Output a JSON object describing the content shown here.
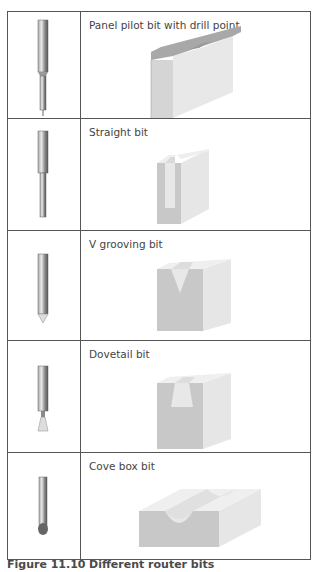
{
  "rows": [
    {
      "label": "Panel pilot bit with drill point",
      "bit_icon": "panel-pilot-bit-icon",
      "cut_icon": "panel-pilot-cut-icon"
    },
    {
      "label": "Straight bit",
      "bit_icon": "straight-bit-icon",
      "cut_icon": "straight-cut-icon"
    },
    {
      "label": "V grooving bit",
      "bit_icon": "v-grooving-bit-icon",
      "cut_icon": "v-groove-cut-icon"
    },
    {
      "label": "Dovetail bit",
      "bit_icon": "dovetail-bit-icon",
      "cut_icon": "dovetail-cut-icon"
    },
    {
      "label": "Cove box bit",
      "bit_icon": "cove-box-bit-icon",
      "cut_icon": "cove-cut-icon"
    }
  ],
  "caption": {
    "number": "Figure 11.10",
    "text": "Different router bits"
  },
  "colors": {
    "border": "#555555",
    "wood_face": "#c8c8c8",
    "wood_light": "#e6e6e6",
    "wood_top": "#f0f0f0",
    "bit_dark": "#777777"
  }
}
